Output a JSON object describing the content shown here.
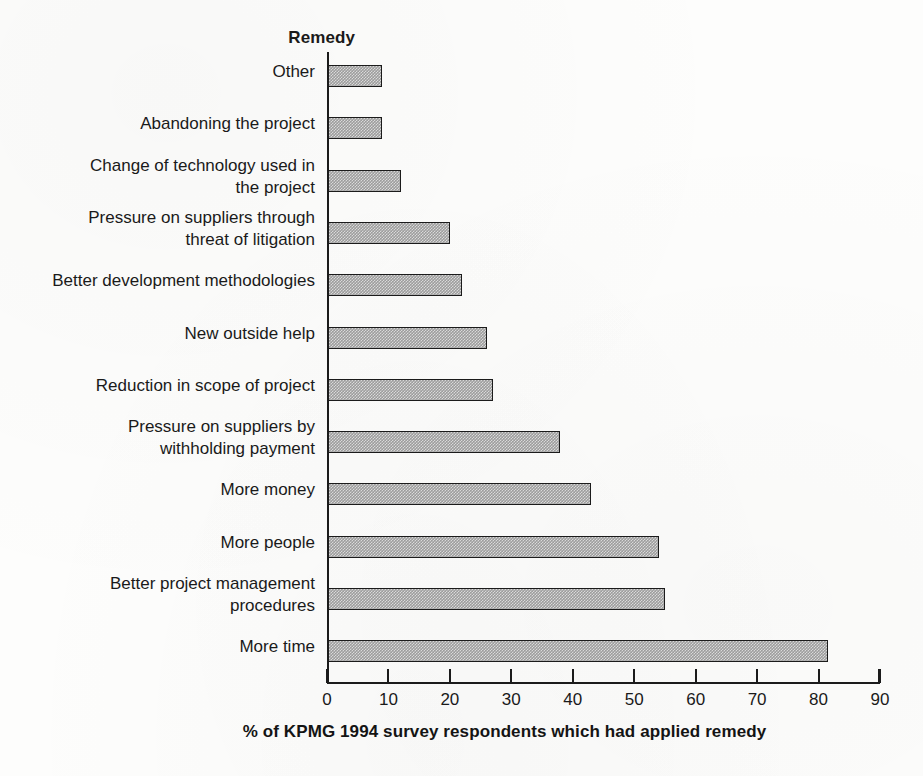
{
  "chart_data": {
    "type": "bar",
    "orientation": "horizontal",
    "title": "",
    "xlabel": "% of KPMG 1994 survey respondents which had applied remedy",
    "ylabel": "Remedy",
    "xlim": [
      0,
      90
    ],
    "xticks": [
      0,
      10,
      20,
      30,
      40,
      50,
      60,
      70,
      80,
      90
    ],
    "xtick_labels": [
      "0",
      "10",
      "20",
      "30",
      "40",
      "50",
      "60",
      "70",
      "80",
      "90"
    ],
    "grid": false,
    "legend": false,
    "bar_color": "#9d9d9d",
    "bar_edge_color": "#1b1b1b",
    "background_color": "#ffffff",
    "categories": [
      "Other",
      "Abandoning the project",
      "Change of technology used in\nthe project",
      "Pressure on suppliers through\nthreat of litigation",
      "Better development methodologies",
      "New outside help",
      "Reduction in scope of project",
      "Pressure on suppliers by\nwithholding payment",
      "More money",
      "More people",
      "Better project management\nprocedures",
      "More time"
    ],
    "values": [
      9,
      9,
      12,
      20,
      22,
      26,
      27,
      38,
      43,
      54,
      55,
      81.5
    ]
  }
}
